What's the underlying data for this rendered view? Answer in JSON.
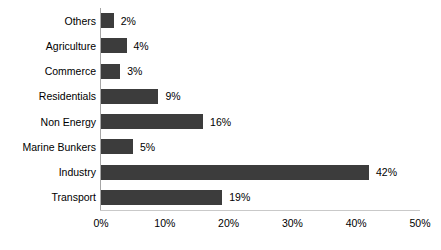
{
  "chart_data": {
    "type": "bar",
    "orientation": "horizontal",
    "title": "",
    "subtitle": "",
    "xlabel": "",
    "ylabel": "",
    "categories": [
      "Others",
      "Agriculture",
      "Commerce",
      "Residentials",
      "Non Energy",
      "Marine Bunkers",
      "Industry",
      "Transport"
    ],
    "values": [
      2,
      4,
      3,
      9,
      16,
      5,
      42,
      19
    ],
    "value_labels": [
      "2%",
      "4%",
      "3%",
      "9%",
      "16%",
      "5%",
      "42%",
      "19%"
    ],
    "xlim": [
      0,
      50
    ],
    "xticks": [
      0,
      10,
      20,
      30,
      40,
      50
    ],
    "xtick_labels": [
      "0%",
      "10%",
      "20%",
      "30%",
      "40%",
      "50%"
    ],
    "grid": false,
    "legend": null,
    "series": [
      {
        "name": "",
        "color": "#3c3c3c",
        "values": [
          2,
          4,
          3,
          9,
          16,
          5,
          42,
          19
        ]
      }
    ],
    "colors": {
      "bar": "#3c3c3c",
      "axis": "#a6a6a6",
      "axis_bottom": "#c9c9c9",
      "text": "#000000",
      "background": "#ffffff"
    }
  }
}
